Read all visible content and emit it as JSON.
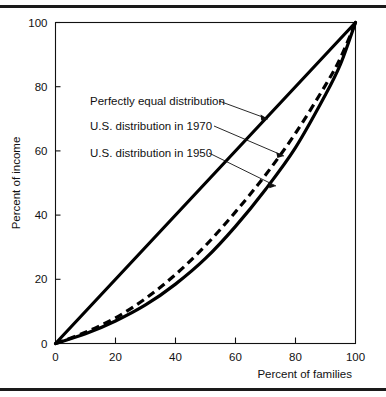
{
  "figure": {
    "kind": "lorenz-curve-figure",
    "background": "#ffffff",
    "ink": "#000000",
    "rule_top": "horizontal-rule",
    "rule_bottom": "horizontal-rule"
  },
  "chart_data": {
    "type": "line",
    "title": "",
    "subtitle": "",
    "xlabel": "Percent of families",
    "ylabel": "Percent of income",
    "xlim": [
      0,
      100
    ],
    "ylim": [
      0,
      100
    ],
    "xticks": [
      0,
      20,
      40,
      60,
      80,
      100
    ],
    "yticks": [
      0,
      20,
      40,
      60,
      80,
      100
    ],
    "xtick_labels": [
      "0",
      "20",
      "40",
      "60",
      "80",
      "100"
    ],
    "ytick_labels": [
      "0",
      "20",
      "40",
      "60",
      "80",
      "100"
    ],
    "grid": false,
    "legend_position": "inline-annotations",
    "x": [
      0,
      10,
      20,
      30,
      40,
      50,
      60,
      70,
      80,
      90,
      95,
      100
    ],
    "series": [
      {
        "name": "Perfectly equal distribution",
        "style": "solid",
        "values": [
          0,
          10,
          20,
          30,
          40,
          50,
          60,
          70,
          80,
          90,
          95,
          100
        ]
      },
      {
        "name": "U.S. distribution in 1970",
        "style": "dashed",
        "values": [
          0,
          3.5,
          8,
          14,
          21.5,
          30.5,
          41,
          52.5,
          65.5,
          80.5,
          89,
          100
        ]
      },
      {
        "name": "U.S. distribution in 1950",
        "style": "solid",
        "values": [
          0,
          3,
          7,
          12,
          18.5,
          26.5,
          36.5,
          48,
          61,
          77.5,
          87,
          100
        ]
      }
    ],
    "annotations": [
      {
        "id": "annot-equal",
        "label": "Perfectly equal distribution",
        "target_series": "Perfectly equal distribution"
      },
      {
        "id": "annot-1970",
        "label": "U.S. distribution in 1970",
        "target_series": "U.S. distribution in 1970"
      },
      {
        "id": "annot-1950",
        "label": "U.S. distribution in 1950",
        "target_series": "U.S. distribution in 1950"
      }
    ]
  }
}
